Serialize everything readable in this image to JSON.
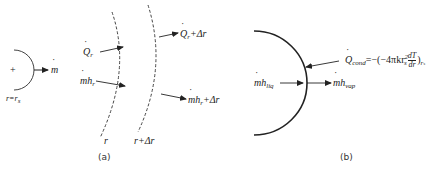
{
  "figure": {
    "panel_a": {
      "caption": "(a)",
      "droplet": {
        "plus_sign": "+",
        "mass_flow": "m",
        "radius_label": "r=r",
        "radius_sub": "s"
      },
      "inner_surface_label": "r",
      "outer_surface_label": "r+Δr",
      "arrows": {
        "heat_in": {
          "symbol": "Q",
          "sub": "r"
        },
        "enthalpy_in": {
          "symbol": "mh",
          "sub": "r"
        },
        "heat_out": {
          "symbol": "Q",
          "sub": "r",
          "suffix": "+Δr"
        },
        "enthalpy_out": {
          "symbol": "mh",
          "sub": "r",
          "suffix": "+Δr"
        }
      }
    },
    "panel_b": {
      "caption": "(b)",
      "liquid_enthalpy": {
        "symbol": "mh",
        "sub": "liq"
      },
      "vapor_enthalpy": {
        "symbol": "mh",
        "sub": "vap"
      },
      "conduction": {
        "symbol": "Q",
        "sub": "cond",
        "equals": "=",
        "expression_prefix": "−(−4πkr",
        "r_sub": "s",
        "r_sup": "2",
        "deriv_num": "dT",
        "deriv_den": "dr",
        "close": ")",
        "eval_sub": "r",
        "eval_subsub": "s"
      }
    },
    "colors": {
      "line": "#333333",
      "background": "#ffffff"
    }
  }
}
